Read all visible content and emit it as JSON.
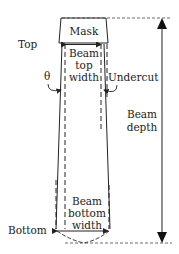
{
  "diagram": {
    "labels": {
      "top": "Top",
      "bottom": "Bottom",
      "mask": "Mask",
      "theta": "θ",
      "undercut": "Undercut",
      "beam_top_width": [
        "Beam",
        "top",
        "width"
      ],
      "beam_depth": [
        "Beam",
        "depth"
      ],
      "beam_bottom_width": [
        "Beam",
        "bottom",
        "width"
      ]
    },
    "colors": {
      "stroke": "#222222",
      "background": "#ffffff"
    }
  }
}
